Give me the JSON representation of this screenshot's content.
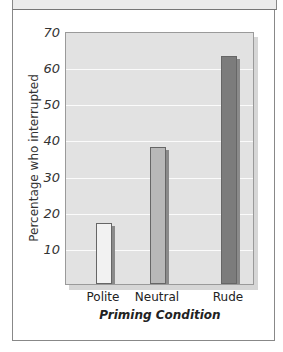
{
  "chart_data": {
    "type": "bar",
    "title": "",
    "xlabel": "Priming Condition",
    "ylabel": "Percentage who interrupted",
    "categories": [
      "Polite",
      "Neutral",
      "Rude"
    ],
    "values": [
      17,
      38,
      63
    ],
    "colors": [
      "#f2f2f2",
      "#b8b8b8",
      "#7c7c7c"
    ],
    "ylim": [
      0,
      70
    ],
    "yticks": [
      10,
      20,
      30,
      40,
      50,
      60,
      70
    ],
    "grid": true,
    "legend": null
  }
}
